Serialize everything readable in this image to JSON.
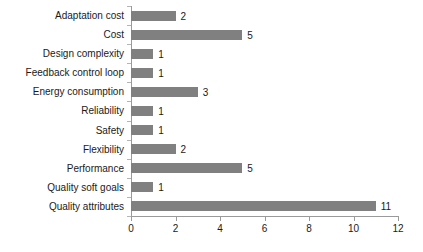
{
  "chart_data": {
    "type": "bar",
    "orientation": "horizontal",
    "title": "",
    "xlabel": "",
    "ylabel": "",
    "xlim": [
      0,
      12
    ],
    "xticks": [
      0,
      2,
      4,
      6,
      8,
      10,
      12
    ],
    "grid": false,
    "legend": null,
    "bar_color": "#808080",
    "axis_color": "#9a9a9a",
    "text_color": "#1a1a1a",
    "categories": [
      "Adaptation cost",
      "Cost",
      "Design complexity",
      "Feedback control loop",
      "Energy consumption",
      "Reliability",
      "Safety",
      "Flexibility",
      "Performance",
      "Quality soft goals",
      "Quality attributes"
    ],
    "values": [
      2,
      5,
      1,
      1,
      3,
      1,
      1,
      2,
      5,
      1,
      11
    ],
    "data_labels": [
      "2",
      "5",
      "1",
      "1",
      "3",
      "1",
      "1",
      "2",
      "5",
      "1",
      "11"
    ]
  }
}
